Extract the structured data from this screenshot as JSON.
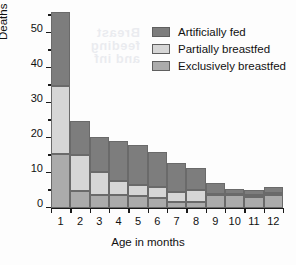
{
  "chart_data": {
    "type": "bar",
    "title": "",
    "subtitle": "",
    "xlabel": "Age in months",
    "ylabel": "Deaths per 1000 infants",
    "categories": [
      "1",
      "2",
      "3",
      "4",
      "5",
      "6",
      "7",
      "8",
      "9",
      "10",
      "11",
      "12"
    ],
    "xlim": [
      0.5,
      12.5
    ],
    "ylim": [
      0,
      56
    ],
    "yticks": [
      0,
      10,
      20,
      30,
      40,
      50
    ],
    "yticks_minor": [
      5,
      15,
      25,
      35,
      45,
      55
    ],
    "grid": false,
    "stacked": true,
    "legend_position": "top-right",
    "series": [
      {
        "name": "Exclusively breastfed",
        "color": "#ababab",
        "values": [
          15.5,
          5.0,
          3.8,
          3.6,
          3.4,
          3.0,
          1.7,
          1.8,
          3.6,
          3.6,
          3.1,
          3.6
        ]
      },
      {
        "name": "Partially breastfed",
        "color": "#d6d6d6",
        "values": [
          19.5,
          10.2,
          6.6,
          4.0,
          3.3,
          3.1,
          3.0,
          3.4,
          0.5,
          0.4,
          0.5,
          0.6
        ]
      },
      {
        "name": "Artificially fed",
        "color": "#7d7d7d",
        "values": [
          21.0,
          9.8,
          10.0,
          11.5,
          11.4,
          10.0,
          8.3,
          6.2,
          3.0,
          1.4,
          1.5,
          1.8
        ]
      }
    ],
    "totals": [
      56.0,
      25.0,
      20.4,
      19.1,
      18.1,
      16.1,
      13.0,
      11.4,
      7.1,
      5.4,
      5.1,
      6.0
    ],
    "annotations": []
  },
  "legend": {
    "items": [
      {
        "label": "Artificially fed",
        "color": "#7d7d7d"
      },
      {
        "label": "Partially breastfed",
        "color": "#d6d6d6"
      },
      {
        "label": "Exclusively breastfed",
        "color": "#ababab"
      }
    ]
  },
  "bleed_text": "Breastfeeding and infant mortality"
}
